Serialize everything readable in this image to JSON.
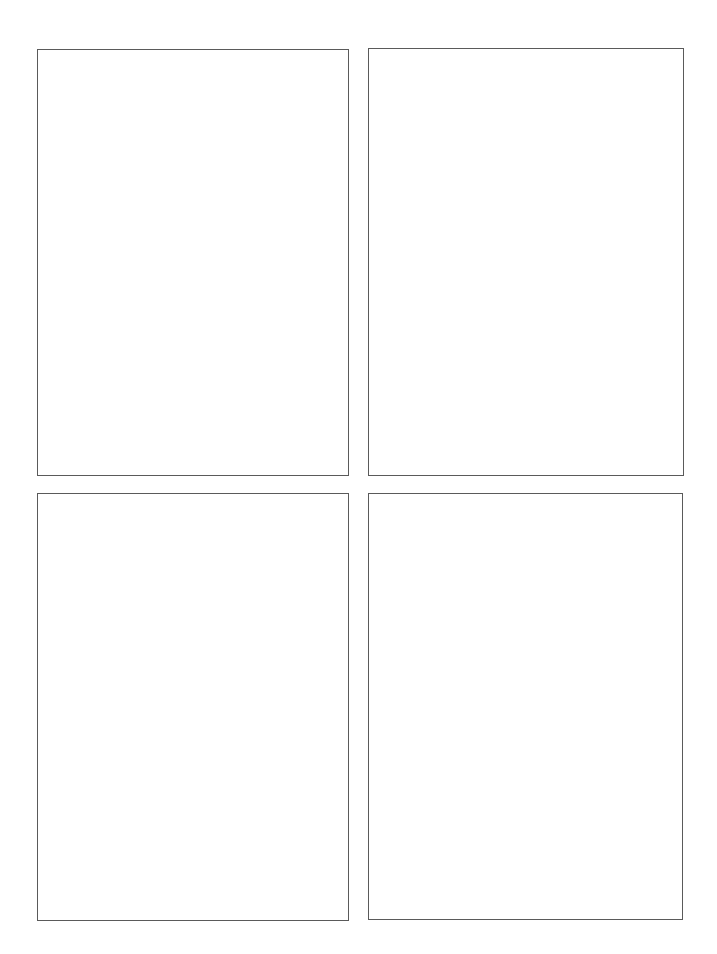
{
  "page": {
    "background": "#ffffff",
    "border_color": "#5a5a5a"
  },
  "panels": [
    {
      "id": "top-left",
      "x": 37,
      "y": 49,
      "width": 312,
      "height": 427,
      "content": ""
    },
    {
      "id": "top-right",
      "x": 368,
      "y": 48,
      "width": 316,
      "height": 428,
      "content": ""
    },
    {
      "id": "bottom-left",
      "x": 37,
      "y": 493,
      "width": 312,
      "height": 428,
      "content": ""
    },
    {
      "id": "bottom-right",
      "x": 368,
      "y": 493,
      "width": 315,
      "height": 427,
      "content": ""
    }
  ]
}
